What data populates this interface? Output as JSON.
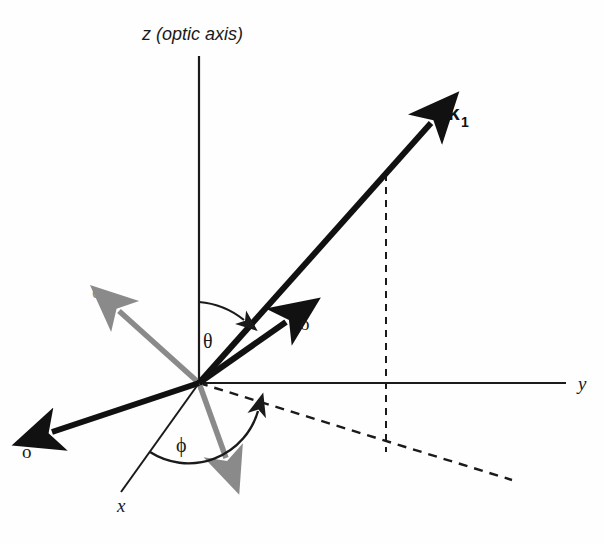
{
  "figure": {
    "background_color": "#fefefe",
    "width": 604,
    "height": 543
  },
  "colors": {
    "stroke_black": "#111111",
    "stroke_axis": "#1a1a1a",
    "stroke_gray": "#8a8a8a",
    "background": "#fefefe"
  },
  "axes": {
    "z": {
      "label": "z (optic axis)",
      "label_x": 142,
      "label_y": 40,
      "line": {
        "x1": 199,
        "y1": 56,
        "x2": 199,
        "y2": 383
      }
    },
    "y": {
      "label": "y",
      "label_x": 578,
      "label_y": 390,
      "line": {
        "x1": 199,
        "y1": 383,
        "x2": 566,
        "y2": 383
      }
    },
    "x": {
      "label": "x",
      "label_x": 117,
      "label_y": 512,
      "line": {
        "x1": 199,
        "y1": 383,
        "x2": 121,
        "y2": 492
      }
    }
  },
  "vectors": {
    "k1": {
      "label": "k",
      "subscript": "1",
      "label_x": 448,
      "label_y": 120,
      "color": "#111111",
      "style": "bold-arrow",
      "line": {
        "x1": 199,
        "y1": 383,
        "x2": 437,
        "y2": 117
      }
    },
    "o_upper": {
      "label": "o",
      "label_x": 300,
      "label_y": 330,
      "color": "#111111",
      "style": "bold-arrow",
      "line": {
        "x1": 199,
        "y1": 383,
        "x2": 291,
        "y2": 318
      }
    },
    "o_lower": {
      "label": "o",
      "label_x": 22,
      "label_y": 458,
      "color": "#111111",
      "style": "bold-arrow",
      "line": {
        "x1": 199,
        "y1": 383,
        "x2": 45,
        "y2": 434
      }
    },
    "e_upper": {
      "label": "e",
      "label_x": 92,
      "label_y": 298,
      "color": "#8a8a8a",
      "style": "gray-arrow",
      "line": {
        "x1": 199,
        "y1": 383,
        "x2": 115,
        "y2": 307
      }
    },
    "e_lower": {
      "label": "e",
      "label_x": 231,
      "label_y": 480,
      "color": "#8a8a8a",
      "style": "gray-arrow",
      "line": {
        "x1": 199,
        "y1": 383,
        "x2": 229,
        "y2": 464
      }
    }
  },
  "angles": {
    "theta": {
      "symbol": "θ",
      "label_x": 203,
      "label_y": 348,
      "description": "polar angle from z (optic axis) to k1"
    },
    "phi": {
      "symbol": "ϕ",
      "label_x": 176,
      "label_y": 452,
      "description": "azimuthal angle from x axis to the projection of k1"
    }
  },
  "projection": {
    "vertical_dashed": {
      "x1": 386,
      "y1": 174,
      "x2": 386,
      "y2": 452
    },
    "slanted_dashed": {
      "x1": 199,
      "y1": 383,
      "x2": 512,
      "y2": 480
    },
    "style": "dashed"
  }
}
